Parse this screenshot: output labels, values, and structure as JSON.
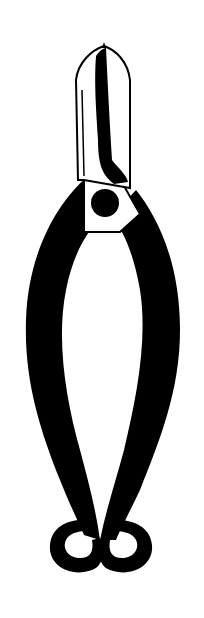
{
  "image": {
    "subject": "Black-and-white illustration of pruning shears / pliers",
    "background": "#ffffff",
    "ink": "#000000"
  }
}
